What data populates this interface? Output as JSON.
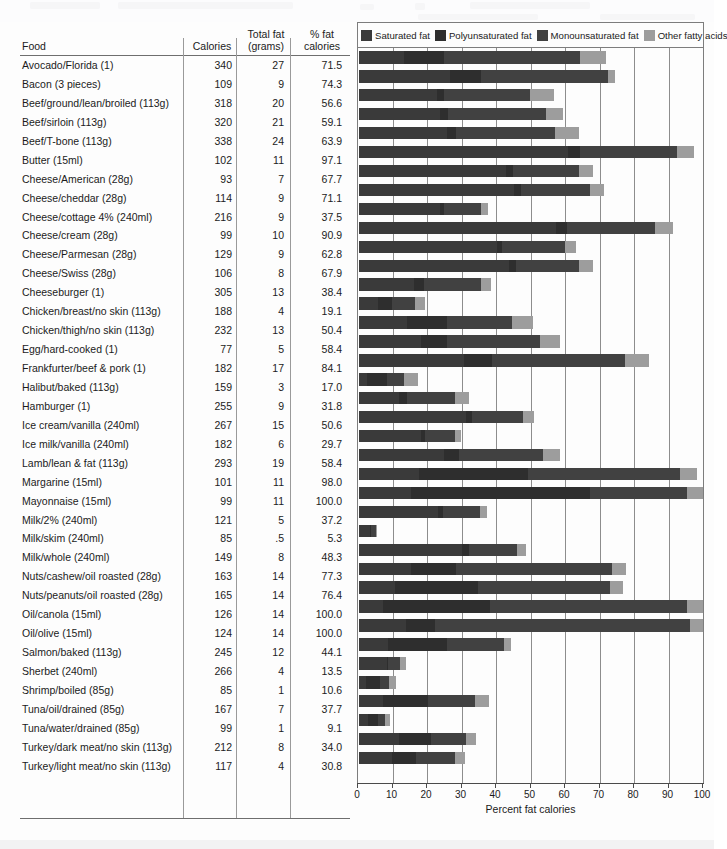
{
  "table": {
    "headers": {
      "food": "Food",
      "calories": "Calories",
      "total_fat": "Total fat\n(grams)",
      "pct_fat": "% fat\ncalories"
    }
  },
  "legend": {
    "items": [
      {
        "label": "Saturated fat",
        "color": "#3a3a3a"
      },
      {
        "label": "Polyunsaturated fat",
        "color": "#2e2e2e"
      },
      {
        "label": "Monounsaturated fat",
        "color": "#414141"
      },
      {
        "label": "Other fatty acids",
        "color": "#9d9d9d"
      }
    ]
  },
  "axis": {
    "title": "Percent fat calories",
    "ticks": [
      0,
      10,
      20,
      30,
      40,
      50,
      60,
      70,
      80,
      90,
      100
    ],
    "min": 0,
    "max": 100
  },
  "chart_data": {
    "type": "bar",
    "orientation": "horizontal",
    "stacked": true,
    "title": "",
    "xlabel": "Percent fat calories",
    "ylabel": "Food",
    "xlim": [
      0,
      100
    ],
    "grid": "vertical",
    "legend_position": "top",
    "series": [
      {
        "name": "Saturated fat",
        "color": "#3a3a3a"
      },
      {
        "name": "Polyunsaturated fat",
        "color": "#2e2e2e"
      },
      {
        "name": "Monounsaturated fat",
        "color": "#414141"
      },
      {
        "name": "Other fatty acids",
        "color": "#9d9d9d"
      }
    ],
    "categories": [
      "Avocado/Florida (1)",
      "Bacon (3 pieces)",
      "Beef/ground/lean/broiled (113g)",
      "Beef/sirloin (113g)",
      "Beef/T-bone (113g)",
      "Butter (15ml)",
      "Cheese/American (28g)",
      "Cheese/cheddar (28g)",
      "Cheese/cottage 4% (240ml)",
      "Cheese/cream (28g)",
      "Cheese/Parmesan (28g)",
      "Cheese/Swiss (28g)",
      "Cheeseburger (1)",
      "Chicken/breast/no skin (113g)",
      "Chicken/thigh/no skin (113g)",
      "Egg/hard-cooked (1)",
      "Frankfurter/beef & pork (1)",
      "Halibut/baked (113g)",
      "Hamburger (1)",
      "Ice cream/vanilla (240ml)",
      "Ice milk/vanilla (240ml)",
      "Lamb/lean & fat (113g)",
      "Margarine (15ml)",
      "Mayonnaise (15ml)",
      "Milk/2% (240ml)",
      "Milk/skim (240ml)",
      "Milk/whole (240ml)",
      "Nuts/cashew/oil roasted (28g)",
      "Nuts/peanuts/oil roasted (28g)",
      "Oil/canola (15ml)",
      "Oil/olive (15ml)",
      "Salmon/baked (113g)",
      "Sherbet (240ml)",
      "Shrimp/boiled (85g)",
      "Tuna/oil/drained (85g)",
      "Tuna/water/drained (85g)",
      "Turkey/dark meat/no skin (113g)",
      "Turkey/light meat/no skin (113g)"
    ],
    "rows": [
      {
        "food": "Avocado/Florida (1)",
        "calories": "340",
        "total_fat": "27",
        "pct_fat": "71.5",
        "total": 71.5,
        "segments": [
          13.0,
          11.5,
          39.5,
          7.5
        ]
      },
      {
        "food": "Bacon (3 pieces)",
        "calories": "109",
        "total_fat": "9",
        "pct_fat": "74.3",
        "total": 74.3,
        "segments": [
          26.5,
          9.0,
          36.8,
          2.0
        ]
      },
      {
        "food": "Beef/ground/lean/broiled (113g)",
        "calories": "318",
        "total_fat": "20",
        "pct_fat": "56.6",
        "total": 56.6,
        "segments": [
          22.5,
          2.0,
          25.1,
          7.0
        ]
      },
      {
        "food": "Beef/sirloin (113g)",
        "calories": "320",
        "total_fat": "21",
        "pct_fat": "59.1",
        "total": 59.1,
        "segments": [
          23.5,
          2.2,
          28.4,
          5.0
        ]
      },
      {
        "food": "Beef/T-bone (113g)",
        "calories": "338",
        "total_fat": "24",
        "pct_fat": "63.9",
        "total": 63.9,
        "segments": [
          25.5,
          2.5,
          28.9,
          7.0
        ]
      },
      {
        "food": "Butter (15ml)",
        "calories": "102",
        "total_fat": "11",
        "pct_fat": "97.1",
        "total": 97.1,
        "segments": [
          60.5,
          3.6,
          28.0,
          5.0
        ]
      },
      {
        "food": "Cheese/American (28g)",
        "calories": "93",
        "total_fat": "7",
        "pct_fat": "67.7",
        "total": 67.7,
        "segments": [
          42.5,
          2.0,
          19.2,
          4.0
        ]
      },
      {
        "food": "Cheese/cheddar (28g)",
        "calories": "114",
        "total_fat": "9",
        "pct_fat": "71.1",
        "total": 71.1,
        "segments": [
          45.0,
          2.0,
          20.1,
          4.0
        ]
      },
      {
        "food": "Cheese/cottage 4% (240ml)",
        "calories": "216",
        "total_fat": "9",
        "pct_fat": "37.5",
        "total": 37.5,
        "segments": [
          23.5,
          1.2,
          10.8,
          2.0
        ]
      },
      {
        "food": "Cheese/cream (28g)",
        "calories": "99",
        "total_fat": "10",
        "pct_fat": "90.9",
        "total": 90.9,
        "segments": [
          57.0,
          3.3,
          25.6,
          5.0
        ]
      },
      {
        "food": "Cheese/Parmesan (28g)",
        "calories": "129",
        "total_fat": "9",
        "pct_fat": "62.8",
        "total": 62.8,
        "segments": [
          40.0,
          1.4,
          18.4,
          3.0
        ]
      },
      {
        "food": "Cheese/Swiss (28g)",
        "calories": "106",
        "total_fat": "8",
        "pct_fat": "67.9",
        "total": 67.9,
        "segments": [
          43.5,
          2.0,
          18.4,
          4.0
        ]
      },
      {
        "food": "Cheeseburger (1)",
        "calories": "305",
        "total_fat": "13",
        "pct_fat": "38.4",
        "total": 38.4,
        "segments": [
          16.0,
          2.8,
          16.6,
          3.0
        ]
      },
      {
        "food": "Chicken/breast/no skin (113g)",
        "calories": "188",
        "total_fat": "4",
        "pct_fat": "19.1",
        "total": 19.1,
        "segments": [
          5.4,
          4.2,
          6.5,
          3.0
        ]
      },
      {
        "food": "Chicken/thigh/no skin (113g)",
        "calories": "232",
        "total_fat": "13",
        "pct_fat": "50.4",
        "total": 50.4,
        "segments": [
          14.0,
          11.4,
          19.0,
          6.0
        ]
      },
      {
        "food": "Egg/hard-cooked (1)",
        "calories": "77",
        "total_fat": "5",
        "pct_fat": "58.4",
        "total": 58.4,
        "segments": [
          18.0,
          7.4,
          27.0,
          6.0
        ]
      },
      {
        "food": "Frankfurter/beef & pork (1)",
        "calories": "182",
        "total_fat": "17",
        "pct_fat": "84.1",
        "total": 84.1,
        "segments": [
          30.5,
          8.0,
          38.6,
          7.0
        ]
      },
      {
        "food": "Halibut/baked (113g)",
        "calories": "159",
        "total_fat": "3",
        "pct_fat": "17.0",
        "total": 17.0,
        "segments": [
          2.4,
          5.6,
          5.0,
          4.0
        ]
      },
      {
        "food": "Hamburger (1)",
        "calories": "255",
        "total_fat": "9",
        "pct_fat": "31.8",
        "total": 31.8,
        "segments": [
          11.5,
          2.3,
          14.0,
          4.0
        ]
      },
      {
        "food": "Ice cream/vanilla (240ml)",
        "calories": "267",
        "total_fat": "15",
        "pct_fat": "50.6",
        "total": 50.6,
        "segments": [
          31.0,
          1.9,
          14.7,
          3.0
        ]
      },
      {
        "food": "Ice milk/vanilla (240ml)",
        "calories": "182",
        "total_fat": "6",
        "pct_fat": "29.7",
        "total": 29.7,
        "segments": [
          18.0,
          1.1,
          8.6,
          2.0
        ]
      },
      {
        "food": "Lamb/lean & fat (113g)",
        "calories": "293",
        "total_fat": "19",
        "pct_fat": "58.4",
        "total": 58.4,
        "segments": [
          24.5,
          4.4,
          24.5,
          5.0
        ]
      },
      {
        "food": "Margarine (15ml)",
        "calories": "101",
        "total_fat": "11",
        "pct_fat": "98.0",
        "total": 98.0,
        "segments": [
          17.5,
          31.5,
          44.0,
          5.0
        ]
      },
      {
        "food": "Mayonnaise (15ml)",
        "calories": "99",
        "total_fat": "11",
        "pct_fat": "100.0",
        "total": 100.0,
        "segments": [
          15.0,
          52.0,
          28.0,
          5.0
        ]
      },
      {
        "food": "Milk/2% (240ml)",
        "calories": "121",
        "total_fat": "5",
        "pct_fat": "37.2",
        "total": 37.2,
        "segments": [
          23.0,
          1.4,
          10.8,
          2.0
        ]
      },
      {
        "food": "Milk/skim (240ml)",
        "calories": "85",
        "total_fat": ".5",
        "pct_fat": "5.3",
        "total": 5.3,
        "segments": [
          3.3,
          0.2,
          1.3,
          0.5
        ]
      },
      {
        "food": "Milk/whole (240ml)",
        "calories": "149",
        "total_fat": "8",
        "pct_fat": "48.3",
        "total": 48.3,
        "segments": [
          30.0,
          1.8,
          14.0,
          2.5
        ]
      },
      {
        "food": "Nuts/cashew/oil roasted (28g)",
        "calories": "163",
        "total_fat": "14",
        "pct_fat": "77.3",
        "total": 77.3,
        "segments": [
          15.0,
          13.0,
          45.3,
          4.0
        ]
      },
      {
        "food": "Nuts/peanuts/oil roasted (28g)",
        "calories": "165",
        "total_fat": "14",
        "pct_fat": "76.4",
        "total": 76.4,
        "segments": [
          10.5,
          24.0,
          38.4,
          3.5
        ]
      },
      {
        "food": "Oil/canola (15ml)",
        "calories": "126",
        "total_fat": "14",
        "pct_fat": "100.0",
        "total": 100.0,
        "segments": [
          7.0,
          31.0,
          57.0,
          5.0
        ]
      },
      {
        "food": "Oil/olive (15ml)",
        "calories": "124",
        "total_fat": "14",
        "pct_fat": "100.0",
        "total": 100.0,
        "segments": [
          13.5,
          8.5,
          74.0,
          4.0
        ]
      },
      {
        "food": "Salmon/baked (113g)",
        "calories": "245",
        "total_fat": "12",
        "pct_fat": "44.1",
        "total": 44.1,
        "segments": [
          8.5,
          17.0,
          16.6,
          2.0
        ]
      },
      {
        "food": "Sherbet (240ml)",
        "calories": "266",
        "total_fat": "4",
        "pct_fat": "13.5",
        "total": 13.5,
        "segments": [
          8.0,
          0.5,
          3.5,
          1.5
        ]
      },
      {
        "food": "Shrimp/boiled (85g)",
        "calories": "85",
        "total_fat": "1",
        "pct_fat": "10.6",
        "total": 10.6,
        "segments": [
          2.0,
          4.0,
          2.6,
          2.0
        ]
      },
      {
        "food": "Tuna/oil/drained (85g)",
        "calories": "167",
        "total_fat": "7",
        "pct_fat": "37.7",
        "total": 37.7,
        "segments": [
          7.0,
          13.0,
          13.7,
          4.0
        ]
      },
      {
        "food": "Tuna/water/drained (85g)",
        "calories": "99",
        "total_fat": "1",
        "pct_fat": "9.1",
        "total": 9.1,
        "segments": [
          2.5,
          3.0,
          2.1,
          1.5
        ]
      },
      {
        "food": "Turkey/dark meat/no skin (113g)",
        "calories": "212",
        "total_fat": "8",
        "pct_fat": "34.0",
        "total": 34.0,
        "segments": [
          11.5,
          9.5,
          10.0,
          3.0
        ]
      },
      {
        "food": "Turkey/light meat/no skin (113g)",
        "calories": "117",
        "total_fat": "4",
        "pct_fat": "30.8",
        "total": 30.8,
        "segments": [
          9.5,
          7.0,
          11.3,
          3.0
        ]
      }
    ]
  }
}
